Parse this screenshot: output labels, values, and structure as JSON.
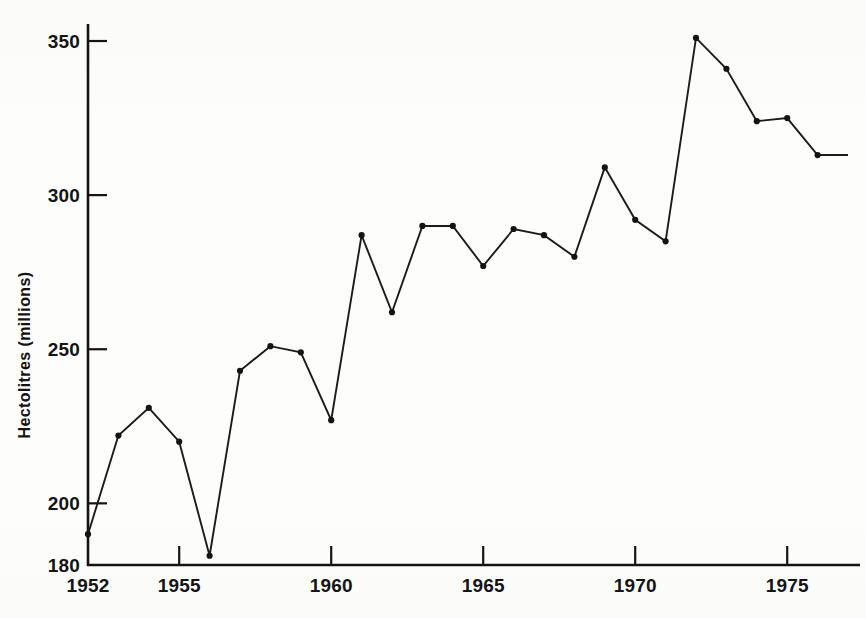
{
  "chart_data": {
    "type": "line",
    "title": "",
    "subtitle": "",
    "xlabel": "",
    "ylabel": "Hectolitres  (millions)",
    "xlim": [
      1952,
      1977
    ],
    "ylim": [
      180,
      355
    ],
    "grid": false,
    "legend": null,
    "x_ticks": [
      1952,
      1955,
      1960,
      1965,
      1970,
      1975
    ],
    "x_tick_labels": [
      "1952",
      "1955",
      "1960",
      "1965",
      "1970",
      "1975"
    ],
    "x_minor_ticks": [],
    "y_ticks": [
      180,
      200,
      250,
      300,
      350
    ],
    "y_tick_labels": [
      "180",
      "200",
      "250",
      "300",
      "350"
    ],
    "marker": "filled-circle",
    "line_color": "#1b1b1b",
    "marker_color": "#141414",
    "axis_color": "#141414",
    "background_color": "#fdfdfb",
    "x": [
      1952,
      1953,
      1954,
      1955,
      1956,
      1957,
      1958,
      1959,
      1960,
      1961,
      1962,
      1963,
      1964,
      1965,
      1966,
      1967,
      1968,
      1969,
      1970,
      1971,
      1972,
      1973,
      1974,
      1975,
      1976,
      1977
    ],
    "values": [
      190,
      222,
      231,
      220,
      183,
      243,
      251,
      249,
      227,
      287,
      262,
      290,
      290,
      277,
      289,
      287,
      280,
      309,
      292,
      285,
      351,
      341,
      324,
      325,
      313,
      313
    ],
    "points": [
      {
        "x": 1952,
        "y": 190
      },
      {
        "x": 1953,
        "y": 222
      },
      {
        "x": 1954,
        "y": 231
      },
      {
        "x": 1955,
        "y": 220
      },
      {
        "x": 1956,
        "y": 183
      },
      {
        "x": 1957,
        "y": 243
      },
      {
        "x": 1958,
        "y": 251
      },
      {
        "x": 1959,
        "y": 249
      },
      {
        "x": 1960,
        "y": 227
      },
      {
        "x": 1961,
        "y": 287
      },
      {
        "x": 1962,
        "y": 262
      },
      {
        "x": 1963,
        "y": 290
      },
      {
        "x": 1964,
        "y": 290
      },
      {
        "x": 1965,
        "y": 277
      },
      {
        "x": 1966,
        "y": 289
      },
      {
        "x": 1967,
        "y": 287
      },
      {
        "x": 1968,
        "y": 280
      },
      {
        "x": 1969,
        "y": 309
      },
      {
        "x": 1970,
        "y": 292
      },
      {
        "x": 1971,
        "y": 285
      },
      {
        "x": 1972,
        "y": 351
      },
      {
        "x": 1973,
        "y": 341
      },
      {
        "x": 1974,
        "y": 324
      },
      {
        "x": 1975,
        "y": 325
      },
      {
        "x": 1976,
        "y": 313
      }
    ]
  }
}
